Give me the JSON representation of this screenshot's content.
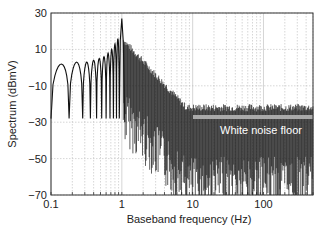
{
  "chart_data": {
    "type": "line",
    "title": "",
    "xlabel": "Baseband frequency (Hz)",
    "ylabel": "Spectrum (dBmV)",
    "xscale": "log",
    "xlim": [
      0.1,
      500
    ],
    "ylim": [
      -70,
      30
    ],
    "xticks": [
      "0.1",
      "1",
      "10",
      "100"
    ],
    "yticks": [
      "30",
      "10",
      "−10",
      "−30",
      "−50",
      "−70"
    ],
    "grid": true,
    "annotations": [
      {
        "text": "White noise floor",
        "level_dBmV": -27,
        "x_start_Hz": 10,
        "x_end_Hz": 500
      }
    ],
    "series": [
      {
        "name": "Spectrum",
        "description": "sinc-like lobes below 1 Hz, peak ~27 dBmV at 1 Hz, decaying to noise floor ~-27 dBmV above 10 Hz",
        "x": [
          0.1,
          0.15,
          0.2,
          0.3,
          0.4,
          0.5,
          0.6,
          0.7,
          0.8,
          0.9,
          1.0,
          1.2,
          2,
          5,
          10,
          100,
          500
        ],
        "y": [
          -30,
          -3,
          -22,
          0,
          2,
          3,
          4,
          6,
          10,
          14,
          27,
          5,
          -5,
          -18,
          -24,
          -26,
          -27
        ]
      }
    ]
  }
}
